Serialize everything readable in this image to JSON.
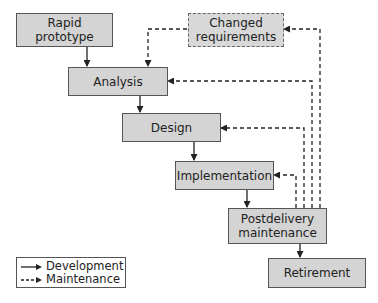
{
  "diagram": {
    "type": "rapid-prototyping life-cycle model",
    "nodes": {
      "rapid_prototype": "Rapid prototype",
      "rapid_prototype_l1": "Rapid",
      "rapid_prototype_l2": "prototype",
      "changed_requirements_l1": "Changed",
      "changed_requirements_l2": "requirements",
      "analysis": "Analysis",
      "design": "Design",
      "implementation": "Implementation",
      "postdelivery_l1": "Postdelivery",
      "postdelivery_l2": "maintenance",
      "retirement": "Retirement"
    },
    "edges": [
      {
        "from": "Rapid prototype",
        "to": "Analysis",
        "style": "Development"
      },
      {
        "from": "Changed requirements",
        "to": "Analysis",
        "style": "Maintenance"
      },
      {
        "from": "Analysis",
        "to": "Design",
        "style": "Development"
      },
      {
        "from": "Design",
        "to": "Implementation",
        "style": "Development"
      },
      {
        "from": "Implementation",
        "to": "Postdelivery maintenance",
        "style": "Development"
      },
      {
        "from": "Postdelivery maintenance",
        "to": "Retirement",
        "style": "Development"
      },
      {
        "from": "Postdelivery maintenance",
        "to": "Implementation",
        "style": "Maintenance"
      },
      {
        "from": "Postdelivery maintenance",
        "to": "Design",
        "style": "Maintenance"
      },
      {
        "from": "Postdelivery maintenance",
        "to": "Analysis",
        "style": "Maintenance"
      },
      {
        "from": "Postdelivery maintenance",
        "to": "Changed requirements",
        "style": "Maintenance"
      }
    ],
    "legend": {
      "development": "Development",
      "maintenance": "Maintenance"
    },
    "colors": {
      "box_fill": "#d4d4d4",
      "box_border": "#555555",
      "line": "#222222"
    }
  }
}
